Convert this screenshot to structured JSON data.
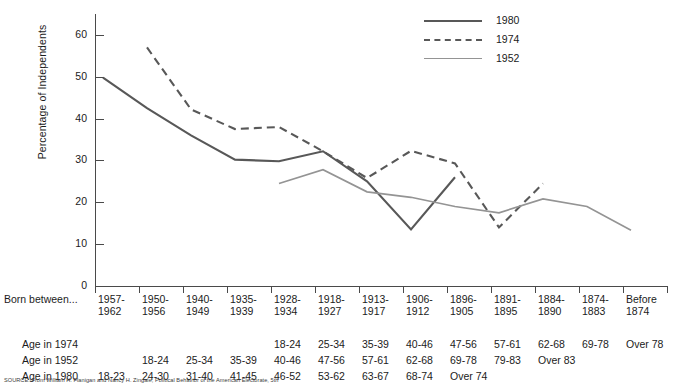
{
  "chart_data": {
    "type": "line",
    "title": "",
    "xlabel": "",
    "ylabel": "Percentage of Independents",
    "ylim": [
      0,
      65
    ],
    "yticks": [
      0,
      10,
      20,
      30,
      40,
      50,
      60
    ],
    "grid": false,
    "legend_position": "top-right",
    "categories": [
      "1957-1962",
      "1950-1956",
      "1940-1949",
      "1935-1939",
      "1928-1934",
      "1918-1927",
      "1913-1917",
      "1906-1912",
      "1896-1905",
      "1891-1895",
      "1884-1890",
      "1874-1883",
      "Before 1874"
    ],
    "series": [
      {
        "name": "1980",
        "style": "solid",
        "color": "#585858",
        "values": [
          49.8,
          42.5,
          36.0,
          30.2,
          29.8,
          32.2,
          25.0,
          13.5,
          26.0,
          null,
          null,
          null,
          null
        ]
      },
      {
        "name": "1974",
        "style": "dashed",
        "color": "#585858",
        "values": [
          null,
          57.0,
          42.2,
          37.5,
          38.0,
          32.2,
          25.8,
          32.3,
          29.3,
          14.0,
          24.5,
          null,
          null
        ]
      },
      {
        "name": "1952",
        "style": "solid",
        "color": "#949494",
        "values": [
          null,
          null,
          null,
          null,
          24.5,
          27.8,
          22.5,
          21.2,
          19.0,
          17.5,
          20.8,
          19.0,
          13.3
        ]
      }
    ]
  },
  "axis": {
    "y_title": "Percentage of Independents",
    "y_tick_labels": [
      "60",
      "50",
      "40",
      "30",
      "20",
      "10",
      "0"
    ]
  },
  "legend": {
    "items": [
      {
        "label": "1980",
        "style": "solid-dark"
      },
      {
        "label": "1974",
        "style": "dashed"
      },
      {
        "label": "1952",
        "style": "solid-light"
      }
    ]
  },
  "table": {
    "row_labels": {
      "born": "Born between...",
      "age1974": "Age in 1974",
      "age1952": "Age in 1952",
      "age1980": "Age in 1980"
    },
    "born": [
      {
        "l1": "1957-",
        "l2": "1962"
      },
      {
        "l1": "1950-",
        "l2": "1956"
      },
      {
        "l1": "1940-",
        "l2": "1949"
      },
      {
        "l1": "1935-",
        "l2": "1939"
      },
      {
        "l1": "1928-",
        "l2": "1934"
      },
      {
        "l1": "1918-",
        "l2": "1927"
      },
      {
        "l1": "1913-",
        "l2": "1917"
      },
      {
        "l1": "1906-",
        "l2": "1912"
      },
      {
        "l1": "1896-",
        "l2": "1905"
      },
      {
        "l1": "1891-",
        "l2": "1895"
      },
      {
        "l1": "1884-",
        "l2": "1890"
      },
      {
        "l1": "1874-",
        "l2": "1883"
      },
      {
        "l1": "Before",
        "l2": "1874"
      }
    ],
    "age1974": [
      "",
      "",
      "",
      "",
      "18-24",
      "25-34",
      "35-39",
      "40-46",
      "47-56",
      "57-61",
      "62-68",
      "69-78",
      "Over 78"
    ],
    "age1952": [
      "",
      "18-24",
      "25-34",
      "35-39",
      "40-46",
      "47-56",
      "57-61",
      "62-68",
      "69-78",
      "79-83",
      "Over 83",
      "",
      ""
    ],
    "age1980": [
      "18-23",
      "24-30",
      "31-40",
      "41-45",
      "46-52",
      "53-62",
      "63-67",
      "68-74",
      "Over 74",
      "",
      "",
      "",
      ""
    ]
  },
  "source": {
    "text": "SOURCE: From William H. Flanigan and Nancy H. Zingale, Political Behavior of the American Electorate, 5th"
  }
}
